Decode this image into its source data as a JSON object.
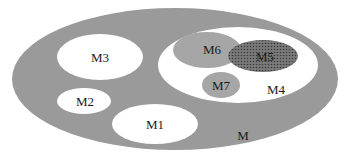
{
  "diagram": {
    "type": "nested-set-diagram",
    "colors": {
      "background": "#ffffff",
      "outer_fill": "#9a9a9a",
      "white_fill": "#ffffff",
      "light_grey_fill": "#a6a6a6",
      "dotted_fill": "#7a7a7a",
      "dot_color": "#3a3a3a",
      "text": "#1a1a1a"
    },
    "sets": [
      {
        "id": "M",
        "label": "M",
        "parent": null,
        "style": "grey"
      },
      {
        "id": "M1",
        "label": "M1",
        "parent": "M",
        "style": "white"
      },
      {
        "id": "M2",
        "label": "M2",
        "parent": "M",
        "style": "white"
      },
      {
        "id": "M3",
        "label": "M3",
        "parent": "M",
        "style": "white"
      },
      {
        "id": "M4",
        "label": "M4",
        "parent": "M",
        "style": "white"
      },
      {
        "id": "M5",
        "label": "M5",
        "parent": "M4",
        "style": "dotted",
        "overlaps": "M6"
      },
      {
        "id": "M6",
        "label": "M6",
        "parent": "M4",
        "style": "light-grey"
      },
      {
        "id": "M7",
        "label": "M7",
        "parent": "M4",
        "style": "light-grey"
      }
    ],
    "labels": {
      "m": "M",
      "m1": "M1",
      "m2": "M2",
      "m3": "M3",
      "m4": "M4",
      "m5": "M5",
      "m6": "M6",
      "m7": "M7"
    }
  }
}
